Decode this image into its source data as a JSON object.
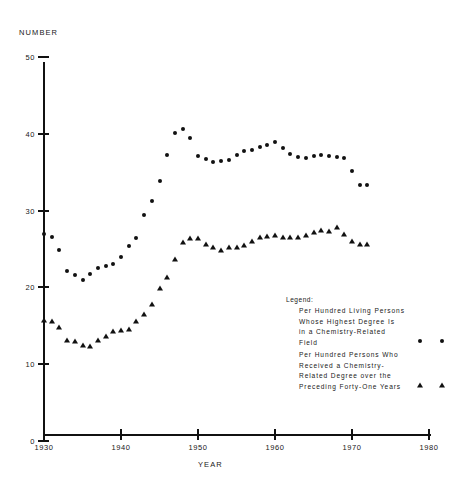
{
  "chart_data": {
    "type": "scatter",
    "title": "",
    "xlabel": "YEAR",
    "ylabel": "NUMBER",
    "xlim": [
      1930,
      1980
    ],
    "ylim": [
      0,
      50
    ],
    "xticks": [
      1930,
      1940,
      1950,
      1960,
      1970,
      1980
    ],
    "yticks": [
      0,
      10,
      20,
      30,
      40,
      50
    ],
    "grid": false,
    "legend_position": "inside-lower-right",
    "series": [
      {
        "name": "Per Hundred Living Persons Whose Highest Degree Is in a Chemistry-Related Field",
        "marker": "circle",
        "color": "#111111",
        "x": [
          1930,
          1931,
          1932,
          1933,
          1934,
          1935,
          1936,
          1937,
          1938,
          1939,
          1940,
          1941,
          1942,
          1943,
          1944,
          1945,
          1946,
          1947,
          1948,
          1949,
          1950,
          1951,
          1952,
          1953,
          1954,
          1955,
          1956,
          1957,
          1958,
          1959,
          1960,
          1961,
          1962,
          1963,
          1964,
          1965,
          1966,
          1967,
          1968,
          1969,
          1970,
          1971,
          1972
        ],
        "y": [
          27.0,
          26.6,
          24.9,
          22.2,
          21.6,
          20.9,
          21.8,
          22.5,
          22.8,
          23.1,
          23.9,
          25.4,
          26.4,
          29.4,
          31.2,
          33.8,
          37.2,
          40.1,
          40.6,
          39.4,
          37.1,
          36.7,
          36.3,
          36.4,
          36.6,
          37.2,
          37.7,
          37.9,
          38.3,
          38.6,
          38.9,
          38.1,
          37.4,
          37.0,
          36.9,
          37.1,
          37.2,
          37.1,
          37.0,
          36.9,
          35.2,
          33.3,
          33.3
        ]
      },
      {
        "name": "Per Hundred Persons Who Received a Chemistry-Related Degree over the Preceding Forty-One Years",
        "marker": "triangle",
        "color": "#111111",
        "x": [
          1930,
          1931,
          1932,
          1933,
          1934,
          1935,
          1936,
          1937,
          1938,
          1939,
          1940,
          1941,
          1942,
          1943,
          1944,
          1945,
          1946,
          1947,
          1948,
          1949,
          1950,
          1951,
          1952,
          1953,
          1954,
          1955,
          1956,
          1957,
          1958,
          1959,
          1960,
          1961,
          1962,
          1963,
          1964,
          1965,
          1966,
          1967,
          1968,
          1969,
          1970,
          1971,
          1972
        ],
        "y": [
          15.7,
          15.6,
          14.8,
          13.2,
          13.0,
          12.5,
          12.4,
          13.2,
          13.7,
          14.3,
          14.5,
          14.6,
          15.6,
          16.5,
          17.9,
          19.9,
          21.3,
          23.7,
          25.9,
          26.4,
          26.4,
          25.6,
          25.2,
          24.9,
          25.2,
          25.2,
          25.5,
          26.1,
          26.5,
          26.7,
          26.8,
          26.5,
          26.6,
          26.6,
          26.8,
          27.2,
          27.5,
          27.3,
          27.9,
          27.0,
          26.0,
          25.6,
          25.6
        ]
      }
    ]
  },
  "legend": {
    "title": "Legend:",
    "entries": [
      {
        "marker": "circle",
        "lines": [
          "Per  Hundred  Living  Persons",
          "Whose  Highest  Degree  Is",
          "in  a    Chemistry-Related",
          "Field"
        ]
      },
      {
        "marker": "triangle",
        "lines": [
          "Per  Hundred  Persons  Who",
          "Received  a  Chemistry-",
          "Related  Degree  over  the",
          "Preceding  Forty-One  Years"
        ]
      }
    ]
  }
}
